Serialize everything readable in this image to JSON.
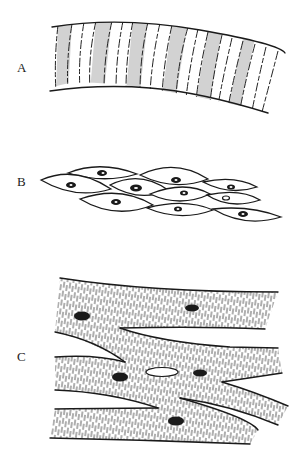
{
  "figure": {
    "panels": [
      {
        "label": "A",
        "type": "skeletal-striated",
        "label_pos": [
          17,
          68
        ]
      },
      {
        "label": "B",
        "type": "smooth",
        "label_pos": [
          17,
          183
        ]
      },
      {
        "label": "C",
        "type": "cardiac",
        "label_pos": [
          17,
          357
        ]
      }
    ],
    "colors": {
      "ink": "#1a1a1a",
      "gray_band": "#d2d2d2",
      "background": "#ffffff"
    }
  }
}
